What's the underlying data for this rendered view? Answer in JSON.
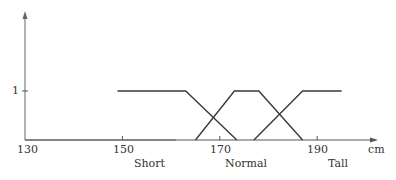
{
  "chart_data": {
    "type": "line",
    "title": "",
    "xlabel": "cm",
    "ylabel": "",
    "xlim": [
      130,
      200
    ],
    "ylim": [
      0,
      1
    ],
    "grid": false,
    "legend": "none",
    "x_ticks": [
      "130",
      "150",
      "170",
      "190"
    ],
    "y_ticks": [
      "1"
    ],
    "series": [
      {
        "name": "Short",
        "x": [
          149,
          163,
          173.5
        ],
        "y": [
          1,
          1,
          0
        ]
      },
      {
        "name": "Normal",
        "x": [
          165,
          173,
          178,
          187
        ],
        "y": [
          0,
          1,
          1,
          0
        ]
      },
      {
        "name": "Tall",
        "x": [
          177,
          187,
          195
        ],
        "y": [
          0,
          1,
          1
        ]
      }
    ],
    "category_labels": [
      {
        "text": "Short",
        "x": 154
      },
      {
        "text": "Normal",
        "x": 172
      },
      {
        "text": "Tall",
        "x": 191
      }
    ]
  },
  "labels": {
    "tick_130": "130",
    "tick_150": "150",
    "tick_170": "170",
    "tick_190": "190",
    "y_one": "1",
    "unit": "cm",
    "short": "Short",
    "normal": "Normal",
    "tall": "Tall"
  },
  "colors": {
    "axis": "#555555",
    "line": "#3a3a3a"
  }
}
